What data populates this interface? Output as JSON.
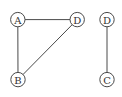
{
  "diagram": {
    "type": "graph",
    "colors": {
      "stroke": "#4a4a4a",
      "text": "#333333",
      "background": "#ffffff"
    },
    "node_radius": 7.2,
    "graphs": [
      {
        "id": "left",
        "nodes": [
          {
            "id": "A",
            "label": "A",
            "x": 17.8,
            "y": 19.6
          },
          {
            "id": "D1",
            "label": "D",
            "x": 77.2,
            "y": 19.6
          },
          {
            "id": "B",
            "label": "B",
            "x": 18.0,
            "y": 79.6
          }
        ],
        "edges": [
          {
            "from": "A",
            "to": "D1"
          },
          {
            "from": "A",
            "to": "B"
          },
          {
            "from": "B",
            "to": "D1"
          }
        ]
      },
      {
        "id": "right",
        "nodes": [
          {
            "id": "D2",
            "label": "D",
            "x": 107.0,
            "y": 19.6
          },
          {
            "id": "C",
            "label": "C",
            "x": 107.0,
            "y": 79.6
          }
        ],
        "edges": [
          {
            "from": "D2",
            "to": "C"
          }
        ]
      }
    ]
  }
}
